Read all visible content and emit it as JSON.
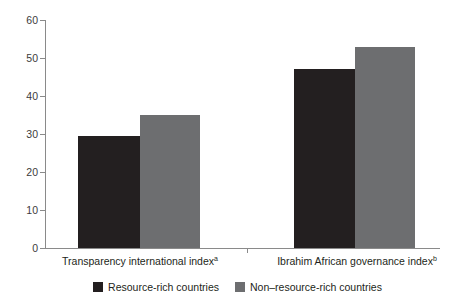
{
  "chart_data": {
    "type": "bar",
    "title": "",
    "xlabel": "",
    "ylabel": "",
    "ylim": [
      0,
      60
    ],
    "yticks": [
      0,
      10,
      20,
      30,
      40,
      50,
      60
    ],
    "grid": false,
    "legend_position": "bottom-center",
    "categories": [
      "Transparency international index",
      "Ibrahim African governance index"
    ],
    "category_footnotes": [
      "a",
      "b"
    ],
    "series": [
      {
        "name": "Resource-rich countries",
        "color": "#231f20",
        "values": [
          29.5,
          47
        ]
      },
      {
        "name": "Non–resource-rich countries",
        "color": "#6d6e70",
        "values": [
          35,
          53
        ]
      }
    ]
  },
  "axis": {
    "tick_labels": [
      "0",
      "10",
      "20",
      "30",
      "40",
      "50",
      "60"
    ]
  },
  "legend": {
    "items": [
      {
        "label": "Resource-rich countries",
        "swatch": "dark"
      },
      {
        "label": "Non–resource-rich countries",
        "swatch": "light"
      }
    ]
  },
  "title_remnant": {
    "text": ""
  }
}
